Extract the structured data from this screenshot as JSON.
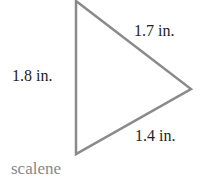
{
  "diagram": {
    "shape": "triangle",
    "stroke_color": "#8a8a8a",
    "sides": [
      {
        "id": "top-right",
        "label": "1.7 in."
      },
      {
        "id": "left",
        "label": "1.8 in."
      },
      {
        "id": "bottom-right",
        "label": "1.4 in."
      }
    ],
    "caption": "scalene"
  }
}
